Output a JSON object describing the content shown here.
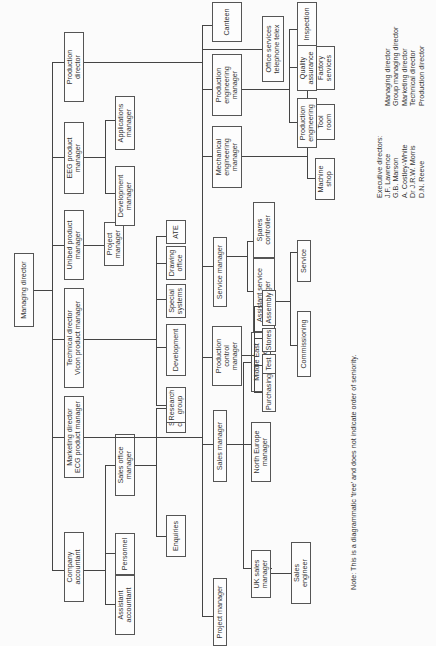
{
  "document": {
    "type": "organisation-chart",
    "orientation": "rotated-90-ccw"
  },
  "nodes": {
    "managing_director": "Managing director",
    "company_accountant": "Company\naccountant",
    "marketing_director": "Marketing director\nECG product manager",
    "technical_director": "Technical director\nVicon product manager",
    "unibed_pm": "Unibed product\nmanager",
    "eeg_pm": "EEG product\nmanager",
    "production_director": "Production\ndirector",
    "assistant_accountant": "Assistant\naccountant",
    "personnel": "Personnel",
    "sales_office_manager": "Sales office\nmanager",
    "enquiries": "Enquiries",
    "shipping_controller": "Shipping\ncontroller",
    "project_manager_mkt": "Project manager",
    "sales_manager": "Sales manager",
    "service_manager": "Service manager",
    "uk_sales_manager": "UK sales\nmanager",
    "north_europe_manager": "North Europe\nmanager",
    "middle_east_manager": "Middle East\nmanager",
    "sales_engineer": "Sales\nengineer",
    "assistant_service_manager": "Assistant service\nmanager",
    "spares_controller": "Spares\ncontroller",
    "commissioning": "Commissioning",
    "service": "Service",
    "research_group": "Research\ngroup",
    "development": "Development",
    "special_systems": "Special\nsystems",
    "drawing_office": "Drawing\noffice",
    "ate": "ATE",
    "project_manager_unibed": "Project\nmanager",
    "development_manager": "Development\nmanager",
    "applications_manager": "Applications\nmanager",
    "production_control_manager": "Production\ncontrol\nmanager",
    "mechanical_engineering_manager": "Mechanical\nengineering\nmanager",
    "production_engineering_manager": "Production\nengineering\nmanager",
    "canteen": "Canteen",
    "office_services": "Office services\ntelephone telex",
    "purchasing": "Purchasing",
    "test": "Test",
    "stores": "Stores",
    "assembly": "Assembly",
    "machine_shop": "Machine\nshop",
    "tool_room": "Tool\nroom",
    "factory_services": "Factory\nservices",
    "production_engineering": "Production\nengineering",
    "quality_assurance": "Quality\nassurance",
    "inspection": "Inspection"
  },
  "executive_directors": {
    "heading": "Executive directors:",
    "names": "J.F. Lawrence\nG.B. Marson\nA. Costley-White\nDr J.R.W. Morris\nD.N. Reeve",
    "roles": "Managing director\nGroup managing director\nMarketing director\nTechnical director\nProduction director"
  },
  "note": "Note: This is a diagrammatic 'tree' and does not indicate order of seniority."
}
